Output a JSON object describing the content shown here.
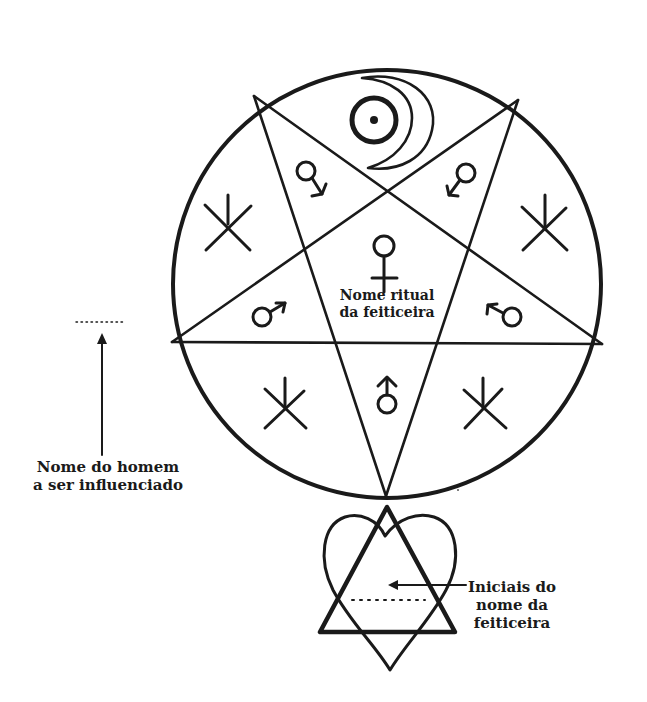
{
  "diagram": {
    "type": "pentagram-sigil",
    "ink_color": "#1a1a1a",
    "background": "#ffffff",
    "center_label": {
      "line1": "Nome ritual",
      "line2": "da feiticeira"
    },
    "left_label": {
      "line1": "Nome do homem",
      "line2": "a ser influenciado"
    },
    "right_label": {
      "line1": "Iniciais do",
      "line2": "nome da",
      "line3": "feiticeira"
    },
    "symbols": {
      "top": "sun-moon-icon",
      "upper_left_inner": "venus-arrow-icon",
      "upper_right_inner": "venus-arrow-icon",
      "center": "venus-icon",
      "left_inner": "mars-icon",
      "right_inner": "mars-reversed-icon",
      "bottom_inner": "mars-up-icon",
      "outer_runes": [
        "rune-upper-left",
        "rune-upper-right",
        "rune-lower-left",
        "rune-lower-right"
      ]
    },
    "lower_emblem": "heart-triangle-icon"
  }
}
